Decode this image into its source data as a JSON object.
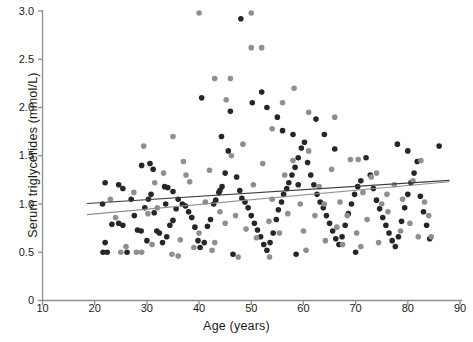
{
  "chart_data": {
    "type": "scatter",
    "title": "",
    "xlabel": "Age (years)",
    "ylabel": "Serum triglycerides  (mmol/L)",
    "xlim": [
      10,
      90
    ],
    "ylim": [
      0,
      3.0
    ],
    "xticks": [
      10,
      20,
      30,
      40,
      50,
      60,
      70,
      80,
      90
    ],
    "yticks": [
      "0",
      "0.5",
      "1.0",
      "1.5",
      "2.0",
      "2.5",
      "3.0"
    ],
    "ytick_values": [
      0,
      0.5,
      1.0,
      1.5,
      2.0,
      2.5,
      3.0
    ],
    "grid": false,
    "legend": "none",
    "colors": {
      "dark": "#262626",
      "gray": "#8f8f8f",
      "axis": "#8d8d8d",
      "background": "#ffffff"
    },
    "marker_size_px": 5.6,
    "series": [
      {
        "name": "group-dark",
        "color": "#262626",
        "points": [
          [
            22.0,
            1.22
          ],
          [
            24.6,
            1.2
          ],
          [
            25.4,
            1.16
          ],
          [
            21.5,
            1.0
          ],
          [
            23.3,
            0.79
          ],
          [
            24.6,
            0.8
          ],
          [
            25.4,
            0.78
          ],
          [
            22.0,
            0.6
          ],
          [
            21.6,
            0.5
          ],
          [
            22.4,
            0.5
          ],
          [
            26.2,
            0.5
          ],
          [
            27.6,
            0.88
          ],
          [
            28.2,
            0.73
          ],
          [
            28.9,
            0.72
          ],
          [
            29.6,
            0.96
          ],
          [
            30.3,
            1.05
          ],
          [
            30.8,
            1.1
          ],
          [
            31.4,
            0.91
          ],
          [
            31.9,
            0.72
          ],
          [
            32.4,
            0.7
          ],
          [
            30.0,
            0.62
          ],
          [
            33.0,
            0.6
          ],
          [
            33.8,
            0.66
          ],
          [
            34.4,
            0.78
          ],
          [
            35.0,
            0.83
          ],
          [
            35.6,
            0.95
          ],
          [
            29.0,
            1.4
          ],
          [
            30.6,
            1.42
          ],
          [
            31.2,
            1.36
          ],
          [
            33.4,
            1.18
          ],
          [
            34.0,
            1.17
          ],
          [
            35.0,
            1.13
          ],
          [
            36.0,
            1.05
          ],
          [
            36.8,
            1.0
          ],
          [
            37.4,
            0.98
          ],
          [
            38.0,
            0.92
          ],
          [
            38.6,
            0.86
          ],
          [
            39.2,
            0.76
          ],
          [
            39.8,
            0.62
          ],
          [
            40.2,
            0.55
          ],
          [
            41.0,
            0.6
          ],
          [
            41.6,
            0.77
          ],
          [
            42.2,
            0.84
          ],
          [
            42.8,
            1.0
          ],
          [
            43.2,
            1.04
          ],
          [
            43.8,
            1.12
          ],
          [
            44.4,
            1.18
          ],
          [
            45.0,
            1.32
          ],
          [
            45.6,
            1.55
          ],
          [
            46.0,
            1.96
          ],
          [
            40.5,
            2.1
          ],
          [
            44.3,
            1.7
          ],
          [
            47.2,
            1.28
          ],
          [
            47.8,
            1.14
          ],
          [
            48.2,
            1.06
          ],
          [
            48.8,
            1.02
          ],
          [
            49.4,
            0.96
          ],
          [
            50.0,
            0.88
          ],
          [
            50.6,
            0.8
          ],
          [
            51.2,
            0.73
          ],
          [
            51.8,
            0.66
          ],
          [
            52.4,
            0.58
          ],
          [
            53.0,
            0.52
          ],
          [
            53.6,
            0.6
          ],
          [
            54.2,
            0.7
          ],
          [
            54.8,
            0.84
          ],
          [
            55.2,
            0.94
          ],
          [
            55.8,
            1.02
          ],
          [
            56.2,
            1.1
          ],
          [
            56.8,
            1.16
          ],
          [
            57.2,
            1.22
          ],
          [
            57.8,
            1.3
          ],
          [
            58.4,
            1.38
          ],
          [
            59.0,
            1.48
          ],
          [
            59.6,
            1.58
          ],
          [
            50.2,
            2.05
          ],
          [
            52.0,
            2.16
          ],
          [
            53.0,
            2.0
          ],
          [
            55.0,
            1.9
          ],
          [
            56.0,
            1.76
          ],
          [
            58.0,
            1.72
          ],
          [
            60.2,
            1.64
          ],
          [
            60.8,
            1.43
          ],
          [
            61.4,
            1.3
          ],
          [
            62.0,
            1.2
          ],
          [
            62.6,
            1.1
          ],
          [
            63.2,
            1.02
          ],
          [
            63.8,
            0.96
          ],
          [
            64.4,
            0.88
          ],
          [
            65.0,
            0.8
          ],
          [
            65.6,
            0.72
          ],
          [
            66.2,
            0.64
          ],
          [
            66.8,
            0.58
          ],
          [
            67.4,
            0.66
          ],
          [
            68.0,
            0.78
          ],
          [
            68.6,
            0.9
          ],
          [
            69.2,
            1.0
          ],
          [
            69.8,
            1.1
          ],
          [
            70.4,
            1.18
          ],
          [
            71.0,
            1.24
          ],
          [
            62.4,
            1.88
          ],
          [
            64.0,
            1.72
          ],
          [
            66.0,
            1.57
          ],
          [
            72.0,
            1.48
          ],
          [
            72.8,
            1.3
          ],
          [
            73.4,
            1.16
          ],
          [
            74.0,
            1.04
          ],
          [
            74.6,
            0.95
          ],
          [
            75.2,
            0.86
          ],
          [
            75.8,
            0.78
          ],
          [
            76.4,
            0.7
          ],
          [
            77.0,
            0.62
          ],
          [
            77.6,
            0.56
          ],
          [
            78.2,
            0.66
          ],
          [
            78.8,
            0.82
          ],
          [
            79.4,
            0.96
          ],
          [
            80.0,
            1.1
          ],
          [
            80.6,
            1.22
          ],
          [
            81.2,
            1.32
          ],
          [
            81.8,
            1.44
          ],
          [
            78.0,
            1.62
          ],
          [
            80.0,
            1.55
          ],
          [
            82.4,
            1.08
          ],
          [
            83.0,
            0.92
          ],
          [
            83.6,
            0.78
          ],
          [
            84.2,
            0.64
          ],
          [
            86.0,
            1.6
          ],
          [
            48.0,
            2.92
          ],
          [
            59.0,
            1.2
          ],
          [
            44.0,
            1.14
          ],
          [
            33.6,
            1.0
          ],
          [
            27.0,
            1.05
          ],
          [
            46.5,
            0.48
          ],
          [
            58.6,
            0.48
          ],
          [
            70.0,
            0.5
          ]
        ]
      },
      {
        "name": "group-gray",
        "color": "#8f8f8f",
        "points": [
          [
            23.0,
            1.05
          ],
          [
            24.0,
            0.86
          ],
          [
            26.0,
            0.56
          ],
          [
            25.0,
            0.5
          ],
          [
            28.0,
            0.5
          ],
          [
            29.4,
            1.6
          ],
          [
            30.2,
            0.9
          ],
          [
            31.0,
            0.58
          ],
          [
            32.0,
            0.96
          ],
          [
            33.2,
            1.32
          ],
          [
            34.8,
            0.48
          ],
          [
            36.4,
            0.63
          ],
          [
            37.0,
            1.44
          ],
          [
            38.2,
            1.23
          ],
          [
            39.0,
            0.55
          ],
          [
            40.0,
            0.7
          ],
          [
            41.2,
            1.02
          ],
          [
            42.0,
            1.35
          ],
          [
            43.0,
            0.6
          ],
          [
            44.0,
            0.92
          ],
          [
            45.2,
            2.08
          ],
          [
            46.2,
            1.5
          ],
          [
            47.0,
            0.88
          ],
          [
            48.4,
            1.62
          ],
          [
            49.0,
            0.74
          ],
          [
            50.4,
            1.2
          ],
          [
            51.0,
            0.65
          ],
          [
            52.2,
            1.42
          ],
          [
            53.4,
            0.82
          ],
          [
            54.0,
            1.05
          ],
          [
            55.4,
            0.7
          ],
          [
            56.4,
            1.3
          ],
          [
            57.0,
            0.9
          ],
          [
            58.2,
            2.2
          ],
          [
            59.4,
            1.0
          ],
          [
            60.0,
            0.72
          ],
          [
            61.0,
            1.55
          ],
          [
            62.2,
            0.88
          ],
          [
            63.0,
            1.18
          ],
          [
            64.2,
            0.62
          ],
          [
            65.4,
            1.36
          ],
          [
            66.4,
            0.76
          ],
          [
            67.0,
            1.02
          ],
          [
            68.4,
            0.88
          ],
          [
            69.0,
            1.46
          ],
          [
            70.2,
            0.7
          ],
          [
            71.4,
            1.12
          ],
          [
            72.2,
            0.84
          ],
          [
            73.0,
            1.28
          ],
          [
            74.4,
            0.6
          ],
          [
            75.0,
            1.0
          ],
          [
            76.2,
            0.92
          ],
          [
            77.4,
            1.2
          ],
          [
            78.6,
            0.72
          ],
          [
            79.0,
            1.05
          ],
          [
            80.4,
            0.8
          ],
          [
            81.0,
            1.24
          ],
          [
            82.0,
            0.66
          ],
          [
            83.2,
            1.02
          ],
          [
            84.0,
            0.88
          ],
          [
            40.0,
            2.98
          ],
          [
            50.0,
            2.98
          ],
          [
            50.0,
            2.62
          ],
          [
            52.0,
            2.62
          ],
          [
            43.0,
            2.3
          ],
          [
            46.0,
            2.3
          ],
          [
            35.0,
            1.7
          ],
          [
            37.5,
            1.3
          ],
          [
            31.5,
            1.22
          ],
          [
            27.5,
            1.12
          ],
          [
            56.0,
            2.05
          ],
          [
            54.0,
            1.78
          ],
          [
            61.0,
            1.95
          ],
          [
            58.0,
            1.45
          ],
          [
            66.0,
            1.9
          ],
          [
            70.5,
            1.46
          ],
          [
            74.0,
            1.32
          ],
          [
            76.0,
            1.1
          ],
          [
            82.5,
            1.45
          ],
          [
            84.5,
            0.66
          ],
          [
            47.5,
            0.45
          ],
          [
            53.5,
            0.45
          ],
          [
            36.0,
            0.46
          ],
          [
            29.0,
            0.5
          ],
          [
            60.5,
            0.52
          ],
          [
            64.0,
            1.0
          ],
          [
            67.5,
            0.58
          ],
          [
            71.0,
            0.56
          ],
          [
            45.0,
            0.8
          ],
          [
            42.5,
            0.52
          ]
        ]
      }
    ],
    "trendlines": [
      {
        "name": "trendline-dark",
        "color": "#3c3c3c",
        "x": [
          18.5,
          88.0
        ],
        "y": [
          1.005,
          1.245
        ]
      },
      {
        "name": "trendline-gray",
        "color": "#909090",
        "x": [
          18.5,
          88.0
        ],
        "y": [
          0.89,
          1.23
        ]
      }
    ]
  }
}
